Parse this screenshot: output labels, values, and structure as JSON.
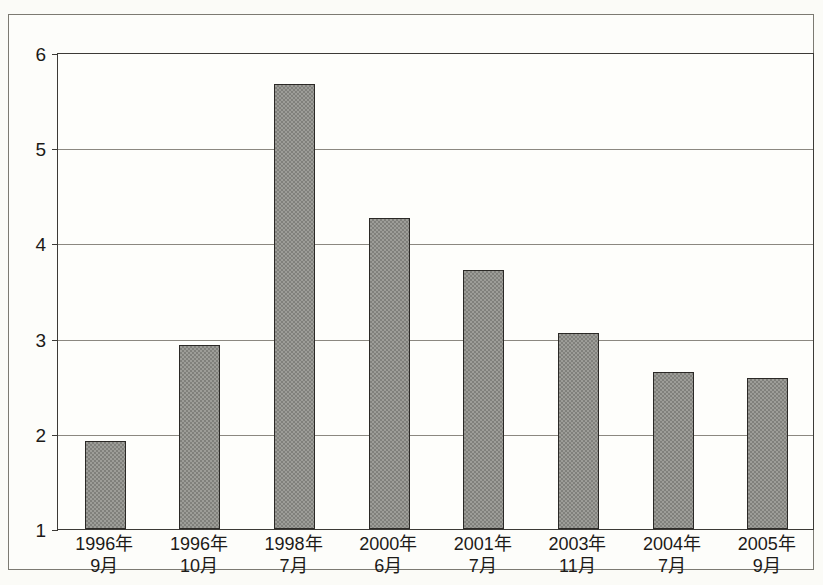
{
  "chart_data": {
    "type": "bar",
    "title": "",
    "xlabel": "",
    "ylabel": "",
    "ylim": [
      1,
      6
    ],
    "yticks": [
      1,
      2,
      3,
      4,
      5,
      6
    ],
    "grid": true,
    "legend": "none",
    "bar_color": "#9d9d98",
    "bar_edge_color": "#2b2926",
    "categories": [
      "1996年\n9月",
      "1996年\n10月",
      "1998年\n7月",
      "2000年\n6月",
      "2001年\n7月",
      "2003年\n11月",
      "2004年\n7月",
      "2005年\n9月"
    ],
    "category_lines": [
      {
        "year": "1996年",
        "month": "9月"
      },
      {
        "year": "1996年",
        "month": "10月"
      },
      {
        "year": "1998年",
        "month": "7月"
      },
      {
        "year": "2000年",
        "month": "6月"
      },
      {
        "year": "2001年",
        "month": "7月"
      },
      {
        "year": "2003年",
        "month": "11月"
      },
      {
        "year": "2004年",
        "month": "7月"
      },
      {
        "year": "2005年",
        "month": "9月"
      }
    ],
    "values": [
      1.92,
      2.93,
      5.66,
      4.26,
      3.72,
      3.05,
      2.65,
      2.58
    ]
  },
  "axis": {
    "y_tick_labels": [
      "6",
      "5",
      "4",
      "3",
      "2",
      "1"
    ]
  }
}
